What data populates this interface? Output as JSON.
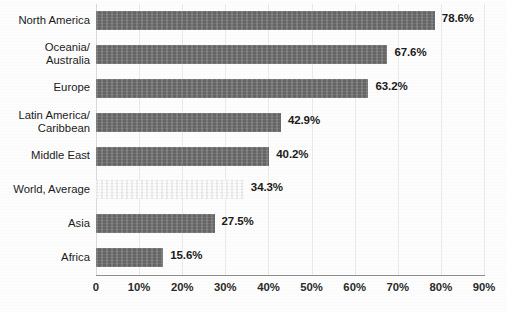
{
  "chart_data": {
    "type": "bar",
    "orientation": "horizontal",
    "title": "",
    "xlabel": "",
    "ylabel": "",
    "xlim": [
      0,
      90
    ],
    "grid": true,
    "legend": "none",
    "categories": [
      "North America",
      "Oceania/\nAustralia",
      "Europe",
      "Latin America/\nCaribbean",
      "Middle East",
      "World, Average",
      "Asia",
      "Africa"
    ],
    "values": [
      78.6,
      67.6,
      63.2,
      42.9,
      40.2,
      34.3,
      27.5,
      15.6
    ],
    "value_labels": [
      "78.6%",
      "67.6%",
      "63.2%",
      "42.9%",
      "40.2%",
      "34.3%",
      "27.5%",
      "15.6%"
    ],
    "bar_styles": [
      "dark",
      "dark",
      "dark",
      "dark",
      "dark",
      "light",
      "dark",
      "dark"
    ],
    "xticks": [
      0,
      10,
      20,
      30,
      40,
      50,
      60,
      70,
      80,
      90
    ],
    "xtick_labels": [
      "0",
      "10%",
      "20%",
      "30%",
      "40%",
      "50%",
      "60%",
      "70%",
      "80%",
      "90%"
    ],
    "colors": {
      "bar_dark": "#6e6e6e",
      "bar_light": "#f2f2f2",
      "gridline": "#e9e9e9",
      "axis": "#8e8e8e",
      "text": "#1b1b1b",
      "background": "#fdfdfd"
    }
  }
}
